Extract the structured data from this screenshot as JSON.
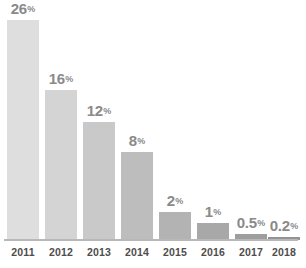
{
  "chart_data": {
    "type": "bar",
    "title": "",
    "subtitle": "",
    "xlabel": "",
    "ylabel": "",
    "categories": [
      "2011",
      "2012",
      "2013",
      "2014",
      "2015",
      "2016",
      "2017",
      "2018"
    ],
    "values": [
      26,
      16,
      12,
      8,
      2,
      1,
      0.5,
      0.2
    ],
    "value_labels": [
      "26",
      "16",
      "12",
      "8",
      "2",
      "1",
      "0.5",
      "0.2"
    ],
    "value_suffix": "%",
    "ylim": [
      0,
      28
    ],
    "grid": false,
    "legend": null,
    "bar_colors": [
      "#dedede",
      "#d4d4d4",
      "#c9c9c9",
      "#bdbdbd",
      "#b3b3b3",
      "#a8a8a8",
      "#9e9e9e",
      "#949494"
    ],
    "label_color": "#8a8a8a",
    "axis_line_color": "#b8b8b8",
    "tick_label_color": "#4d4d4d",
    "background_color": "#ffffff"
  },
  "bars": [
    {
      "year": "2011",
      "value_label": "26",
      "suffix": "%",
      "left": 7,
      "width": 32,
      "height": 220,
      "color": "#dedede",
      "wide_label": false
    },
    {
      "year": "2012",
      "value_label": "16",
      "suffix": "%",
      "left": 45,
      "width": 32,
      "height": 150,
      "color": "#d4d4d4",
      "wide_label": false
    },
    {
      "year": "2013",
      "value_label": "12",
      "suffix": "%",
      "left": 83,
      "width": 32,
      "height": 118,
      "color": "#c9c9c9",
      "wide_label": false
    },
    {
      "year": "2014",
      "value_label": "8",
      "suffix": "%",
      "left": 121,
      "width": 32,
      "height": 88,
      "color": "#bdbdbd",
      "wide_label": false
    },
    {
      "year": "2015",
      "value_label": "2",
      "suffix": "%",
      "left": 159,
      "width": 32,
      "height": 28,
      "color": "#b3b3b3",
      "wide_label": false
    },
    {
      "year": "2016",
      "value_label": "1",
      "suffix": "%",
      "left": 197,
      "width": 32,
      "height": 17,
      "color": "#a8a8a8",
      "wide_label": false
    },
    {
      "year": "2017",
      "value_label": "0.5",
      "suffix": "%",
      "left": 235,
      "width": 32,
      "height": 6,
      "color": "#9e9e9e",
      "wide_label": true
    },
    {
      "year": "2018",
      "value_label": "0.2",
      "suffix": "%",
      "left": 268,
      "width": 32,
      "height": 3,
      "color": "#949494",
      "wide_label": true
    }
  ],
  "axis": {
    "ticks": [
      {
        "label": "2011",
        "left": 7
      },
      {
        "label": "2012",
        "left": 45
      },
      {
        "label": "2013",
        "left": 83
      },
      {
        "label": "2014",
        "left": 121
      },
      {
        "label": "2015",
        "left": 159
      },
      {
        "label": "2016",
        "left": 197
      },
      {
        "label": "2017",
        "left": 235
      },
      {
        "label": "2018",
        "left": 268
      }
    ]
  }
}
